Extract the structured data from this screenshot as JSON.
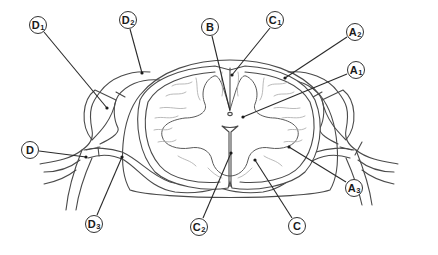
{
  "figure": {
    "labels": [
      {
        "id": "D1",
        "letter": "D",
        "sub": "1",
        "x": 38,
        "y": 25,
        "target": [
          107,
          108
        ]
      },
      {
        "id": "D2",
        "letter": "D",
        "sub": "2",
        "x": 128,
        "y": 20,
        "target": [
          142,
          73
        ]
      },
      {
        "id": "B",
        "letter": "B",
        "sub": "",
        "x": 210,
        "y": 27,
        "target": [
          230,
          114
        ]
      },
      {
        "id": "C1",
        "letter": "C",
        "sub": "1",
        "x": 275,
        "y": 20,
        "target": [
          232,
          75
        ]
      },
      {
        "id": "A2",
        "letter": "A",
        "sub": "2",
        "x": 355,
        "y": 32,
        "target": [
          285,
          78
        ]
      },
      {
        "id": "A1",
        "letter": "A",
        "sub": "1",
        "x": 356,
        "y": 70,
        "target": [
          243,
          117
        ]
      },
      {
        "id": "D",
        "letter": "D",
        "sub": "",
        "x": 30,
        "y": 150,
        "target": [
          86,
          157
        ]
      },
      {
        "id": "D3",
        "letter": "D",
        "sub": "3",
        "x": 94,
        "y": 224,
        "target": [
          122,
          157
        ]
      },
      {
        "id": "C2",
        "letter": "C",
        "sub": "2",
        "x": 199,
        "y": 227,
        "target": [
          231,
          153
        ]
      },
      {
        "id": "C",
        "letter": "C",
        "sub": "",
        "x": 297,
        "y": 226,
        "target": [
          255,
          160
        ]
      },
      {
        "id": "A3",
        "letter": "A",
        "sub": "3",
        "x": 354,
        "y": 188,
        "target": [
          289,
          147
        ]
      }
    ]
  },
  "colors": {
    "line": "#4a4a4a",
    "leader": "#2a2a2a",
    "texture": "#a8a8a8",
    "background": "#ffffff"
  }
}
